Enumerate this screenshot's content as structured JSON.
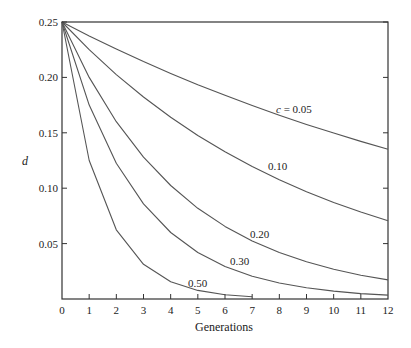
{
  "chart_data": {
    "type": "line",
    "title": "",
    "xlabel": "Generations",
    "ylabel": "d",
    "xlim": [
      0,
      12
    ],
    "ylim": [
      0,
      0.25
    ],
    "grid": false,
    "x_ticks": [
      0,
      1,
      2,
      3,
      4,
      5,
      6,
      7,
      8,
      9,
      10,
      11,
      12
    ],
    "x_tick_labels": [
      "0",
      "1",
      "2",
      "3",
      "4",
      "5",
      "6",
      "7",
      "8",
      "9",
      "10",
      "11",
      "12"
    ],
    "y_ticks": [
      0.05,
      0.1,
      0.15,
      0.2,
      0.25
    ],
    "y_tick_labels": [
      "0.05",
      "0.10",
      "0.15",
      "0.20",
      "0.25"
    ],
    "legend": "inline labels on curves",
    "series": [
      {
        "name": "c = 0.05",
        "label": "c = 0.05",
        "x": [
          0,
          1,
          2,
          3,
          4,
          5,
          6,
          7,
          8,
          9,
          10,
          11,
          12
        ],
        "values": [
          0.25,
          0.2375,
          0.2256,
          0.2143,
          0.2036,
          0.1934,
          0.1838,
          0.1746,
          0.1659,
          0.1576,
          0.1497,
          0.1422,
          0.1351
        ],
        "label_pos": [
          276,
          113
        ]
      },
      {
        "name": "c = 0.10",
        "label": "0.10",
        "x": [
          0,
          1,
          2,
          3,
          4,
          5,
          6,
          7,
          8,
          9,
          10,
          11,
          12
        ],
        "values": [
          0.25,
          0.225,
          0.2025,
          0.1823,
          0.164,
          0.1476,
          0.1329,
          0.1196,
          0.1076,
          0.0968,
          0.0872,
          0.0785,
          0.0706
        ],
        "label_pos": [
          268,
          170
        ]
      },
      {
        "name": "c = 0.20",
        "label": "0.20",
        "x": [
          0,
          1,
          2,
          3,
          4,
          5,
          6,
          7,
          8,
          9,
          10,
          11,
          12
        ],
        "values": [
          0.25,
          0.2,
          0.16,
          0.128,
          0.1024,
          0.0819,
          0.0655,
          0.0524,
          0.0419,
          0.0336,
          0.0268,
          0.0215,
          0.0172
        ],
        "label_pos": [
          250,
          238
        ]
      },
      {
        "name": "c = 0.30",
        "label": "0.30",
        "x": [
          0,
          1,
          2,
          3,
          4,
          5,
          6,
          7,
          8,
          9,
          10,
          11,
          12
        ],
        "values": [
          0.25,
          0.175,
          0.1225,
          0.0858,
          0.06,
          0.042,
          0.0294,
          0.0206,
          0.0144,
          0.0101,
          0.0071,
          0.0049,
          0.0035
        ],
        "label_pos": [
          230,
          265
        ]
      },
      {
        "name": "c = 0.50",
        "label": "0.50",
        "x": [
          0,
          1,
          2,
          3,
          4,
          5,
          6,
          7
        ],
        "values": [
          0.25,
          0.125,
          0.0625,
          0.0313,
          0.0156,
          0.0078,
          0.0039,
          0.002
        ],
        "label_pos": [
          188,
          287
        ]
      }
    ]
  },
  "colors": {
    "line": "#555555",
    "axis": "#333333",
    "text": "#222222"
  }
}
